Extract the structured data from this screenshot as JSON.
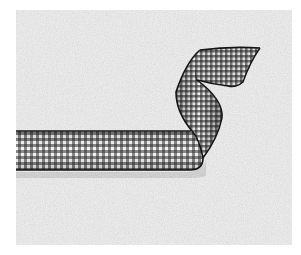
{
  "image": {
    "description": "Black and white gingham ribbon curling over a textured gray stucco background",
    "subject": "gingham ribbon",
    "background": "textured gray surface",
    "colors": {
      "page": "#ffffff",
      "surface": "#cfcfcf",
      "surface_light": "#e2e2e2",
      "surface_dark": "#b4b4b4",
      "ribbon_dark": "#1e1e1e",
      "ribbon_light": "#f4f4f4",
      "ribbon_edge": "#151515"
    },
    "panel": {
      "x": 16,
      "y": 10,
      "width": 276,
      "height": 235
    }
  }
}
